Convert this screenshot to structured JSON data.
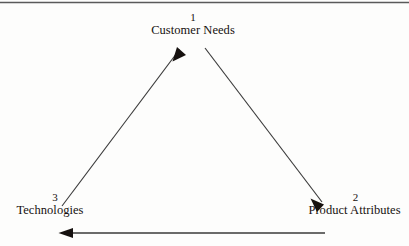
{
  "diagram": {
    "type": "triangular-cycle-diagram",
    "background_color": "#fdfdfc",
    "ink_color": "#16110f",
    "line_color": "#3a3a3a",
    "top_rule": {
      "name": "top-horizontal-rule",
      "color": "#5a5a5a"
    },
    "nodes": [
      {
        "id": "customer-needs",
        "number": "1",
        "label": "Customer Needs",
        "position": "top-center"
      },
      {
        "id": "product-attributes",
        "number": "2",
        "label": "Product Attributes",
        "position": "bottom-right"
      },
      {
        "id": "technologies",
        "number": "3",
        "label": "Technologies",
        "position": "bottom-left"
      }
    ],
    "arrows": [
      {
        "id": "technologies-to-customer-needs",
        "from": "technologies",
        "to": "customer-needs",
        "direction": "up-right"
      },
      {
        "id": "customer-needs-to-product-attributes",
        "from": "customer-needs",
        "to": "product-attributes",
        "direction": "down-right"
      },
      {
        "id": "product-attributes-to-technologies",
        "from": "product-attributes",
        "to": "technologies",
        "direction": "left"
      }
    ]
  }
}
